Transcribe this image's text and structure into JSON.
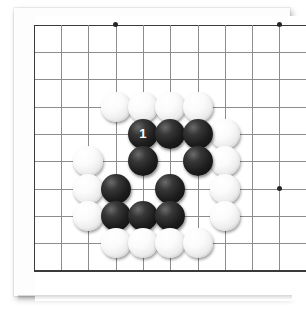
{
  "app": {
    "title": "Go Board Diagram",
    "board_size_label": "19x19 (partial view)"
  },
  "board": {
    "background_color": "#ffffff",
    "line_color": "#8d8d8d",
    "edge_color": "#3a3a3a",
    "origin_x": 33.7,
    "origin_y": 24.7,
    "spacing": 27.3,
    "cols": 10,
    "rows": 10,
    "edges": {
      "left": true,
      "top": true,
      "bottom": true,
      "right": false
    },
    "star_points": [
      {
        "col": 3,
        "row": 0,
        "name": "star-point-upper-left"
      },
      {
        "col": 9,
        "row": 0,
        "name": "star-point-upper-right"
      },
      {
        "col": 9,
        "row": 6,
        "name": "star-point-lower-right"
      }
    ]
  },
  "stones": [
    {
      "col": 3,
      "row": 3,
      "color": "white",
      "label": ""
    },
    {
      "col": 4,
      "row": 3,
      "color": "white",
      "label": ""
    },
    {
      "col": 5,
      "row": 3,
      "color": "white",
      "label": ""
    },
    {
      "col": 6,
      "row": 3,
      "color": "white",
      "label": ""
    },
    {
      "col": 4,
      "row": 4,
      "color": "black",
      "label": "1"
    },
    {
      "col": 5,
      "row": 4,
      "color": "black",
      "label": ""
    },
    {
      "col": 6,
      "row": 4,
      "color": "black",
      "label": ""
    },
    {
      "col": 7,
      "row": 4,
      "color": "white",
      "label": ""
    },
    {
      "col": 2,
      "row": 5,
      "color": "white",
      "label": ""
    },
    {
      "col": 4,
      "row": 5,
      "color": "black",
      "label": ""
    },
    {
      "col": 6,
      "row": 5,
      "color": "black",
      "label": ""
    },
    {
      "col": 7,
      "row": 5,
      "color": "white",
      "label": ""
    },
    {
      "col": 2,
      "row": 6,
      "color": "white",
      "label": ""
    },
    {
      "col": 3,
      "row": 6,
      "color": "black",
      "label": ""
    },
    {
      "col": 5,
      "row": 6,
      "color": "black",
      "label": ""
    },
    {
      "col": 7,
      "row": 6,
      "color": "white",
      "label": ""
    },
    {
      "col": 2,
      "row": 7,
      "color": "white",
      "label": ""
    },
    {
      "col": 3,
      "row": 7,
      "color": "black",
      "label": ""
    },
    {
      "col": 4,
      "row": 7,
      "color": "black",
      "label": ""
    },
    {
      "col": 5,
      "row": 7,
      "color": "black",
      "label": ""
    },
    {
      "col": 7,
      "row": 7,
      "color": "white",
      "label": ""
    },
    {
      "col": 3,
      "row": 8,
      "color": "white",
      "label": ""
    },
    {
      "col": 4,
      "row": 8,
      "color": "white",
      "label": ""
    },
    {
      "col": 5,
      "row": 8,
      "color": "white",
      "label": ""
    },
    {
      "col": 6,
      "row": 8,
      "color": "white",
      "label": ""
    }
  ],
  "move_markers": [
    {
      "number": "1",
      "col": 4,
      "row": 4,
      "color": "black"
    }
  ]
}
